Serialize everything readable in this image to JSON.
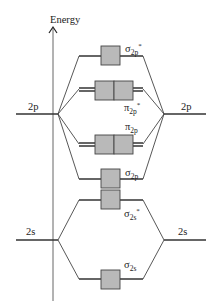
{
  "diagram": {
    "axis_label": "Energy",
    "atomic_orbitals": {
      "left_2p": "2p",
      "right_2p": "2p",
      "left_2s": "2s",
      "right_2s": "2s"
    },
    "molecular_orbitals": [
      {
        "id": "sigma_2p_star",
        "symbol": "σ",
        "subscript": "2p",
        "superscript": "*",
        "boxes": 1
      },
      {
        "id": "pi_2p_star",
        "symbol": "π",
        "subscript": "2p",
        "superscript": "*",
        "boxes": 2
      },
      {
        "id": "pi_2p",
        "symbol": "π",
        "subscript": "2p",
        "superscript": "",
        "boxes": 2
      },
      {
        "id": "sigma_2p",
        "symbol": "σ",
        "subscript": "2p",
        "superscript": "",
        "boxes": 1
      },
      {
        "id": "sigma_2s_star",
        "symbol": "σ",
        "subscript": "2s",
        "superscript": "*",
        "boxes": 1
      },
      {
        "id": "sigma_2s",
        "symbol": "σ",
        "subscript": "2s",
        "superscript": "",
        "boxes": 1
      }
    ],
    "colors": {
      "box_fill": "#b9b9b9",
      "line": "#333333",
      "axis": "#666666"
    }
  }
}
